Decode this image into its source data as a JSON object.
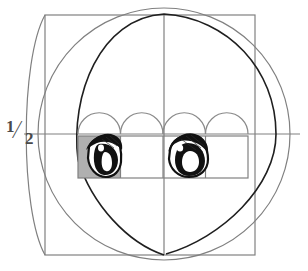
{
  "diagram": {
    "labels": {
      "half_numerator": "1",
      "half_slash": "⁄",
      "half_denominator": "2"
    },
    "colors": {
      "guide_gray": "#7d7d7d",
      "light_gray": "#8c8c8c",
      "outline_black": "#1a1a1a",
      "cell_fill": "#b3b3b3",
      "background": "#ffffff",
      "eye_black": "#111111",
      "eye_white": "#ffffff"
    },
    "geometry": {
      "canvas_width": 308,
      "canvas_height": 271,
      "head_circle": {
        "cx": 164,
        "cy": 134,
        "r": 126
      },
      "square": {
        "x": 45,
        "y": 15,
        "width": 210,
        "height": 240
      },
      "vertical_axis_x": 164,
      "horizontal_axis_y": 134,
      "chin_point": {
        "x": 164,
        "y": 255
      },
      "eye_band": {
        "x": 78,
        "y": 136,
        "width": 170,
        "height": 42
      },
      "eye_band_dividers": [
        78,
        120.5,
        163,
        205.5,
        248
      ],
      "shaded_cell_index": 0,
      "arc_count": 4
    },
    "eyes": [
      {
        "name": "left-eye",
        "cell_index": 0,
        "cx": 100,
        "cy": 157
      },
      {
        "name": "right-eye",
        "cell_index": 2,
        "cx": 185,
        "cy": 157
      }
    ]
  }
}
